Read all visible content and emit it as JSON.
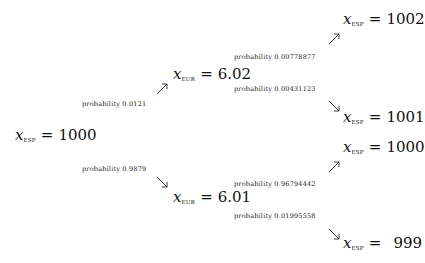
{
  "diagram": {
    "type": "probability-tree",
    "root": {
      "variable": "x",
      "subscript": "ESP",
      "equals": "=",
      "value": "1000"
    },
    "level1": [
      {
        "probability_label": "probability 0.0121",
        "arrow": "arrow-up-right-icon",
        "node": {
          "variable": "x",
          "subscript": "EUR",
          "equals": "=",
          "value": "6.02"
        },
        "children": [
          {
            "probability_label": "probability 0.00778877",
            "arrow": "arrow-up-right-icon",
            "node": {
              "variable": "x",
              "subscript": "ESP",
              "equals": "=",
              "value": "1002"
            }
          },
          {
            "probability_label": "probability 0.00431123",
            "arrow": "arrow-down-right-icon",
            "node": {
              "variable": "x",
              "subscript": "ESP",
              "equals": "=",
              "value": "1001"
            }
          }
        ]
      },
      {
        "probability_label": "probability 0.9879",
        "arrow": "arrow-down-right-icon",
        "node": {
          "variable": "x",
          "subscript": "EUR",
          "equals": "=",
          "value": "6.01"
        },
        "children": [
          {
            "probability_label": "probability 0.96794442",
            "arrow": "arrow-up-right-icon",
            "node": {
              "variable": "x",
              "subscript": "ESP",
              "equals": "=",
              "value": "1000"
            }
          },
          {
            "probability_label": "probability 0.01995558",
            "arrow": "arrow-down-right-icon",
            "node": {
              "variable": "x",
              "subscript": "ESP",
              "equals": "=",
              "value": "999"
            }
          }
        ]
      }
    ]
  },
  "colors": {
    "background": "#ffffff",
    "text": "#111111"
  }
}
